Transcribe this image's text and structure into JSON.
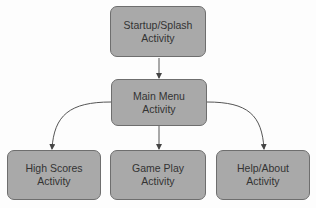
{
  "diagram": {
    "type": "flowchart",
    "nodes": {
      "startup": {
        "line1": "Startup/Splash",
        "line2": "Activity"
      },
      "main_menu": {
        "line1": "Main Menu",
        "line2": "Activity"
      },
      "high_scores": {
        "line1": "High Scores",
        "line2": "Activity"
      },
      "game_play": {
        "line1": "Game Play",
        "line2": "Activity"
      },
      "help_about": {
        "line1": "Help/About",
        "line2": "Activity"
      }
    },
    "edges": [
      {
        "from": "Startup/Splash Activity",
        "to": "Main Menu Activity"
      },
      {
        "from": "Main Menu Activity",
        "to": "High Scores Activity"
      },
      {
        "from": "Main Menu Activity",
        "to": "Game Play Activity"
      },
      {
        "from": "Main Menu Activity",
        "to": "Help/About Activity"
      }
    ],
    "colors": {
      "node_fill": "#a9a9a9",
      "node_border": "#6e6e6e",
      "edge": "#555555",
      "text": "#333333"
    }
  }
}
